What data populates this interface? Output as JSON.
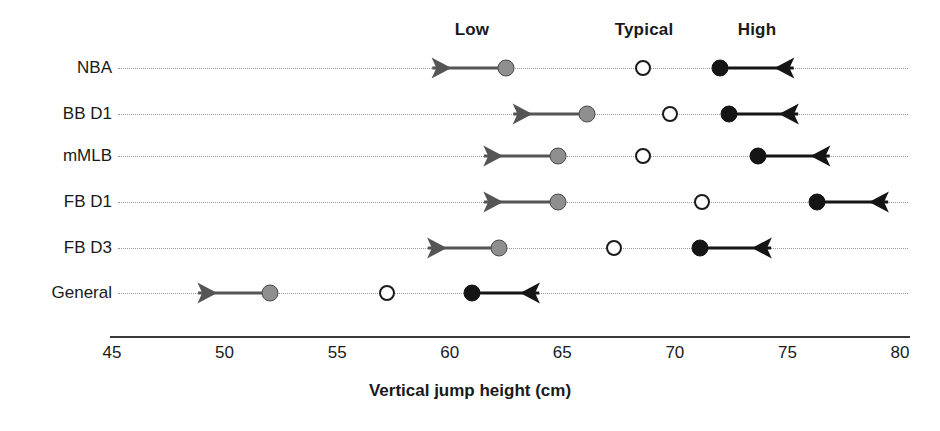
{
  "chart_data": {
    "type": "scatter",
    "title": "",
    "xlabel": "Vertical jump height (cm)",
    "ylabel": "",
    "xlim": [
      45,
      80
    ],
    "xticks": [
      45,
      50,
      55,
      60,
      65,
      70,
      75,
      80
    ],
    "xtick_labels": [
      "45",
      "50",
      "55",
      "60",
      "65",
      "70",
      "75",
      "80"
    ],
    "grid": true,
    "legend_position": "top",
    "column_headers": [
      {
        "label": "Low",
        "value": 61.0,
        "marker": "filled-gray-circle"
      },
      {
        "label": "Typical",
        "value": 68.6,
        "marker": "open-circle"
      },
      {
        "label": "High",
        "value": 73.6,
        "marker": "filled-black-circle"
      }
    ],
    "categories": [
      "NBA",
      "BB D1",
      "mMLB",
      "FB D1",
      "FB D3",
      "General"
    ],
    "series": [
      {
        "name": "Low",
        "values": [
          62.5,
          66.1,
          64.8,
          64.8,
          62.2,
          52.0
        ]
      },
      {
        "name": "Typical",
        "values": [
          68.6,
          69.8,
          68.6,
          71.2,
          67.3,
          57.2
        ]
      },
      {
        "name": "High",
        "values": [
          72.0,
          72.4,
          73.7,
          76.3,
          71.1,
          61.0
        ]
      }
    ],
    "low_arrow_ends": [
      59.0,
      62.6,
      61.3,
      61.3,
      58.8,
      48.6
    ],
    "high_arrow_ends": [
      75.5,
      75.7,
      77.1,
      79.7,
      74.5,
      64.2
    ],
    "colors": {
      "low_marker": "#8f8f8f",
      "low_marker_edge": "#4a4a4a",
      "typical_marker_fill": "#ffffff",
      "typical_marker_edge": "#1a1a1a",
      "high_marker": "#151515",
      "grid_line": "#9a9a9a",
      "axis_line": "#3a3a3a",
      "text": "#1a1a1a",
      "low_arrow": "#555555",
      "high_arrow": "#151515"
    }
  }
}
